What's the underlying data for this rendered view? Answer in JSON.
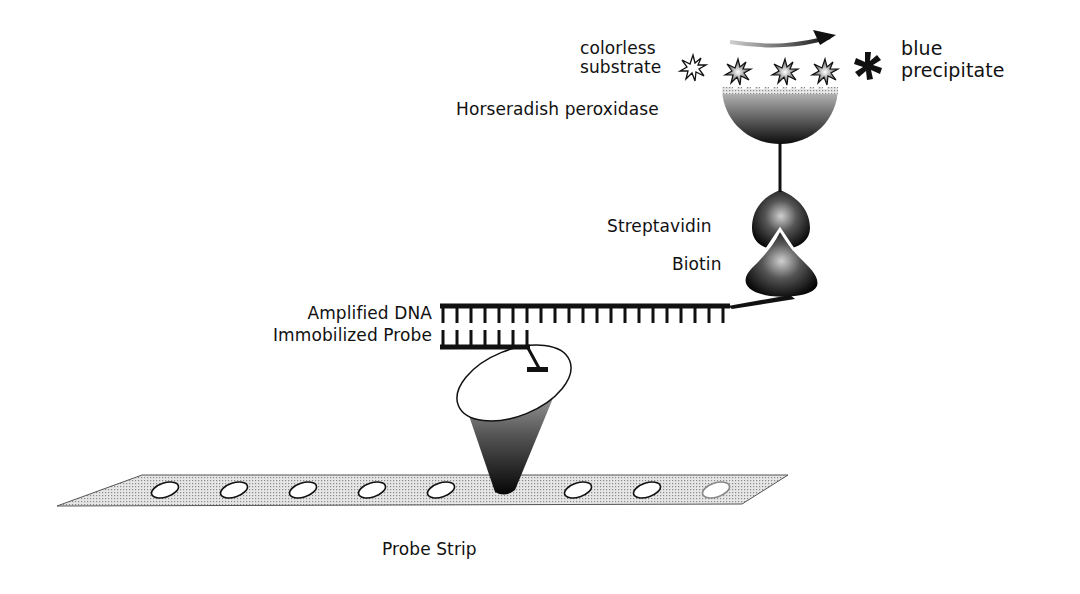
{
  "diagram": {
    "labels": {
      "colorless_substrate_line1": "colorless",
      "colorless_substrate_line2": "substrate",
      "blue_precipitate_line1": "blue",
      "blue_precipitate_line2": "precipitate",
      "horseradish_peroxidase": "Horseradish peroxidase",
      "streptavidin": "Streptavidin",
      "biotin": "Biotin",
      "amplified_dna": "Amplified DNA",
      "immobilized_probe": "Immobilized Probe",
      "probe_strip": "Probe Strip"
    },
    "components": [
      {
        "id": "substrate",
        "icon": "asterisk-outline-icon",
        "state": "colorless"
      },
      {
        "id": "intermediate",
        "icon": "asterisk-shaded-icon",
        "count": 3
      },
      {
        "id": "precipitate",
        "icon": "asterisk-solid-icon",
        "state": "blue"
      },
      {
        "id": "enzyme",
        "name": "Horseradish peroxidase",
        "shape": "hemisphere"
      },
      {
        "id": "streptavidin",
        "shape": "bell"
      },
      {
        "id": "biotin",
        "shape": "cone"
      },
      {
        "id": "amplified-dna",
        "ticks": 20
      },
      {
        "id": "immobilized-probe",
        "ticks": 7
      },
      {
        "id": "probe-spot",
        "shape": "cone"
      },
      {
        "id": "probe-strip",
        "wells": 9
      }
    ],
    "colors": {
      "ink": "#111111",
      "shade_light": "#d8d8d8",
      "shade_dark": "#111111",
      "background": "#ffffff"
    }
  }
}
